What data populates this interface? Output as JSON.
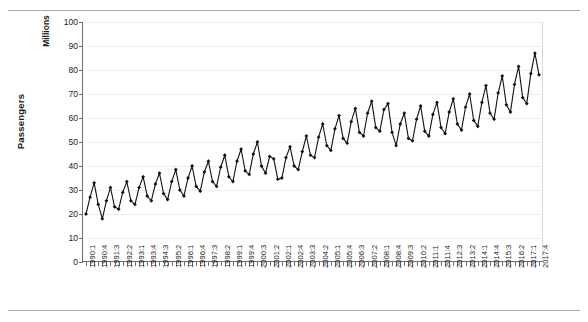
{
  "chart_data": {
    "type": "line",
    "title": "",
    "xlabel": "",
    "ylabel": "Passengers",
    "units_label": "Millions",
    "ylim": [
      0,
      100
    ],
    "yticks": [
      0,
      10,
      20,
      30,
      40,
      50,
      60,
      70,
      80,
      90,
      100
    ],
    "grid": true,
    "legend": "none",
    "marker": "filled-diamond",
    "line_color": "#111111",
    "x_tick_label_every": 3,
    "x": [
      "1990:1",
      "1990:2",
      "1990:3",
      "1990:4",
      "1991:1",
      "1991:2",
      "1991:3",
      "1991:4",
      "1992:1",
      "1992:2",
      "1992:3",
      "1992:4",
      "1993:1",
      "1993:2",
      "1993:3",
      "1993:4",
      "1994:1",
      "1994:2",
      "1994:3",
      "1994:4",
      "1995:1",
      "1995:2",
      "1995:3",
      "1995:4",
      "1996:1",
      "1996:2",
      "1996:3",
      "1996:4",
      "1997:1",
      "1997:2",
      "1997:3",
      "1997:4",
      "1998:1",
      "1998:2",
      "1998:3",
      "1998:4",
      "1999:1",
      "1999:2",
      "1999:3",
      "1999:4",
      "2000:1",
      "2000:2",
      "2000:3",
      "2000:4",
      "2001:1",
      "2001:2",
      "2001:3",
      "2001:4",
      "2002:1",
      "2002:2",
      "2002:3",
      "2002:4",
      "2003:1",
      "2003:2",
      "2003:3",
      "2003:4",
      "2004:1",
      "2004:2",
      "2004:3",
      "2004:4",
      "2005:1",
      "2005:2",
      "2005:3",
      "2005:4",
      "2006:1",
      "2006:2",
      "2006:3",
      "2006:4",
      "2007:1",
      "2007:2",
      "2007:3",
      "2007:4",
      "2008:1",
      "2008:2",
      "2008:3",
      "2008:4",
      "2009:1",
      "2009:2",
      "2009:3",
      "2009:4",
      "2010:1",
      "2010:2",
      "2010:3",
      "2010:4",
      "2011:1",
      "2011:2",
      "2011:3",
      "2011:4",
      "2012:1",
      "2012:2",
      "2012:3",
      "2012:4",
      "2013:1",
      "2013:2",
      "2013:3",
      "2013:4",
      "2014:1",
      "2014:2",
      "2014:3",
      "2014:4",
      "2015:1",
      "2015:2",
      "2015:3",
      "2015:4",
      "2016:1",
      "2016:2",
      "2016:3",
      "2016:4",
      "2017:1",
      "2017:2",
      "2017:3",
      "2017:4"
    ],
    "x_tick_labels_shown": [
      "1990:1",
      "1990:4",
      "1991:3",
      "1992:2",
      "1993:1",
      "1993:4",
      "1994:3",
      "1995:2",
      "1996:1",
      "1996:4",
      "1997:3",
      "1998:2",
      "1999:1",
      "1999:4",
      "2000:3",
      "2001:2",
      "2002:1",
      "2002:4",
      "2003:3",
      "2004:2",
      "2005:1",
      "2005:4",
      "2006:3",
      "2007:2",
      "2008:1",
      "2008:4",
      "2009:3",
      "2010:2",
      "2011:1",
      "2011:4",
      "2012:3",
      "2013:2",
      "2014:1",
      "2014:4",
      "2015:3",
      "2016:2",
      "2017:1",
      "2017:4"
    ],
    "values": [
      20.0,
      27.0,
      33.0,
      24.0,
      18.0,
      25.5,
      31.0,
      23.0,
      22.0,
      29.0,
      33.5,
      25.5,
      24.0,
      31.0,
      35.5,
      27.5,
      25.5,
      32.5,
      37.0,
      28.5,
      26.0,
      33.5,
      38.5,
      30.0,
      27.5,
      35.0,
      40.0,
      31.5,
      29.5,
      37.5,
      42.0,
      33.5,
      31.5,
      39.5,
      44.5,
      35.5,
      33.5,
      42.0,
      47.0,
      38.0,
      36.5,
      45.0,
      50.0,
      40.0,
      37.0,
      44.0,
      43.0,
      34.5,
      35.0,
      43.5,
      48.0,
      40.0,
      38.5,
      46.0,
      52.5,
      44.5,
      43.5,
      52.0,
      57.5,
      48.5,
      46.5,
      55.5,
      61.0,
      51.5,
      49.5,
      58.5,
      64.0,
      54.0,
      52.5,
      62.0,
      67.0,
      56.0,
      54.5,
      63.5,
      66.0,
      54.0,
      48.5,
      57.5,
      62.0,
      51.5,
      50.5,
      59.5,
      65.0,
      54.5,
      52.5,
      61.5,
      66.5,
      56.0,
      53.5,
      62.5,
      68.0,
      57.5,
      55.0,
      64.5,
      70.0,
      59.0,
      56.5,
      66.5,
      73.5,
      62.0,
      59.5,
      70.5,
      77.5,
      65.5,
      62.5,
      74.0,
      81.5,
      68.5,
      66.0,
      78.5,
      87.0,
      78.0
    ]
  },
  "axes": {
    "y_title": "Passengers",
    "y_units": "Millions"
  }
}
